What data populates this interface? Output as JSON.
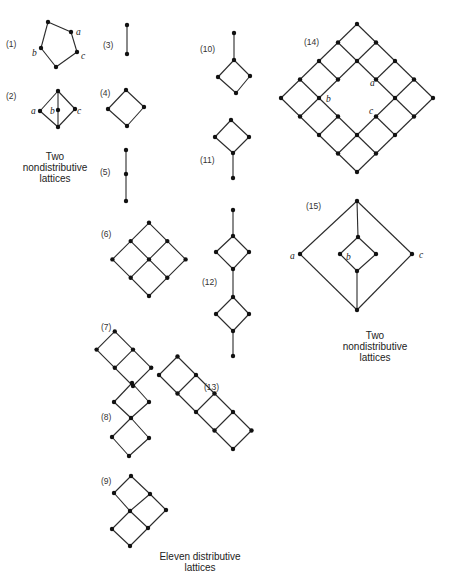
{
  "figure": {
    "captions": {
      "left_nondistributive": [
        "Two",
        "nondistributive",
        "lattices"
      ],
      "right_nondistributive": [
        "Two",
        "nondistributive",
        "lattices"
      ],
      "distributive": [
        "Eleven distributive",
        "lattices"
      ]
    },
    "colors": {
      "ink": "#111111",
      "edge": "#2a2a2a",
      "background": "#ffffff"
    },
    "lattices": [
      {
        "id": 1,
        "label": "(1)",
        "name": "pentagon N5",
        "node_labels": [
          "a",
          "b",
          "c"
        ]
      },
      {
        "id": 2,
        "label": "(2)",
        "name": "diamond M3",
        "node_labels": [
          "a",
          "b",
          "c"
        ]
      },
      {
        "id": 3,
        "label": "(3)",
        "name": "2-chain"
      },
      {
        "id": 4,
        "label": "(4)",
        "name": "2x2 square"
      },
      {
        "id": 5,
        "label": "(5)",
        "name": "3-chain"
      },
      {
        "id": 6,
        "label": "(6)",
        "name": "3x3 grid"
      },
      {
        "id": 7,
        "label": "(7)",
        "name": "2x3 grid"
      },
      {
        "id": 8,
        "label": "(8)",
        "name": "two squares stacked at a point"
      },
      {
        "id": 9,
        "label": "(9)",
        "name": "3x3 grid minus corner"
      },
      {
        "id": 10,
        "label": "(10)",
        "name": "square with top tail"
      },
      {
        "id": 11,
        "label": "(11)",
        "name": "square with bottom tail"
      },
      {
        "id": 12,
        "label": "(12)",
        "name": "chain of two squares with tails"
      },
      {
        "id": 13,
        "label": "(13)",
        "name": "2x5 grid"
      },
      {
        "id": 14,
        "label": "(14)",
        "name": "5x5 grid with center removed",
        "node_labels": [
          "a",
          "b",
          "c"
        ]
      },
      {
        "id": 15,
        "label": "(15)",
        "name": "nondistributive with inner square",
        "node_labels": [
          "a",
          "b",
          "c"
        ]
      }
    ]
  }
}
